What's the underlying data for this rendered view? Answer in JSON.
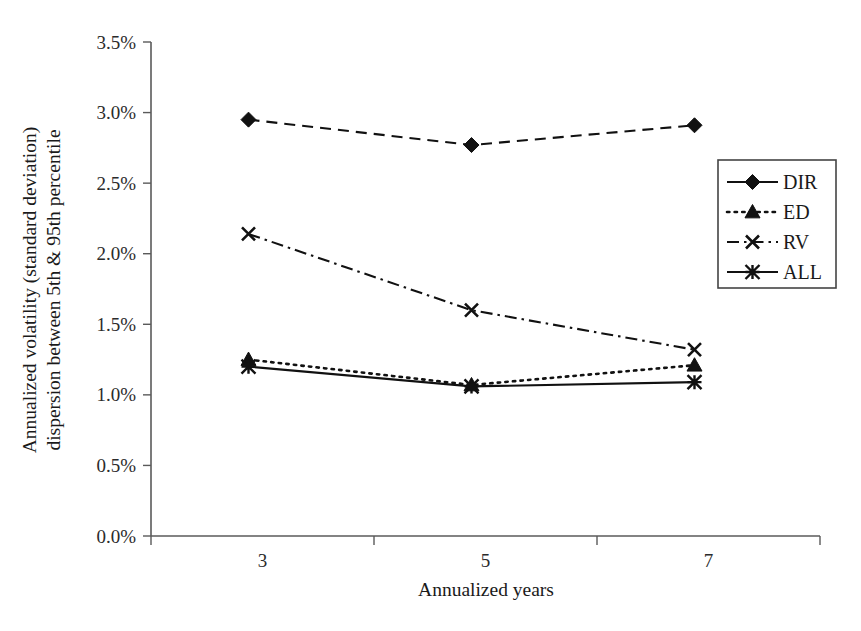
{
  "chart_data": {
    "type": "line",
    "title": "",
    "xlabel": "Annualized years",
    "ylabel": "Annualized volatility (standard deviation) dispersion between 5th & 95th percentile",
    "ylabel_line1": "Annualized volatility (standard deviation)",
    "ylabel_line2": "dispersion between 5th & 95th percentile",
    "categories": [
      "3",
      "5",
      "7"
    ],
    "x": [
      3,
      5,
      7
    ],
    "ylim": [
      0,
      3.5
    ],
    "ytick_values": [
      0.0,
      0.5,
      1.0,
      1.5,
      2.0,
      2.5,
      3.0,
      3.5
    ],
    "ytick_labels": [
      "0.0%",
      "0.5%",
      "1.0%",
      "1.5%",
      "2.0%",
      "2.5%",
      "3.0%",
      "3.5%"
    ],
    "xtick_labels": [
      "3",
      "5",
      "7"
    ],
    "grid": false,
    "legend_position": "right",
    "series": [
      {
        "name": "DIR",
        "values": [
          2.95,
          2.77,
          2.91
        ],
        "marker": "diamond",
        "line_style": "dashed",
        "legend_line_style": "solid",
        "color": "#111111"
      },
      {
        "name": "ED",
        "values": [
          1.25,
          1.07,
          1.21
        ],
        "marker": "triangle",
        "line_style": "dotted",
        "legend_line_style": "dotted",
        "color": "#111111"
      },
      {
        "name": "RV",
        "values": [
          2.14,
          1.6,
          1.32
        ],
        "marker": "cross",
        "line_style": "dashdot",
        "legend_line_style": "dashdot",
        "color": "#111111"
      },
      {
        "name": "ALL",
        "values": [
          1.2,
          1.06,
          1.09
        ],
        "marker": "star",
        "line_style": "solid",
        "legend_line_style": "solid",
        "color": "#111111"
      }
    ]
  },
  "legend": {
    "entries": [
      {
        "label": "DIR"
      },
      {
        "label": "ED"
      },
      {
        "label": "RV"
      },
      {
        "label": "ALL"
      }
    ]
  }
}
